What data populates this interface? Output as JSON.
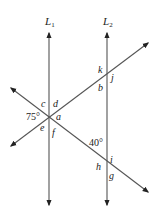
{
  "diagram": {
    "type": "parallel lines cut by two transversals",
    "lines": {
      "L1": {
        "label": "L",
        "subscript": "1"
      },
      "L2": {
        "label": "L",
        "subscript": "2"
      }
    },
    "angle_labels": {
      "a": "a",
      "b": "b",
      "c": "c",
      "d": "d",
      "e": "e",
      "f": "f",
      "g": "g",
      "h": "h",
      "i": "i",
      "j": "j",
      "k": "k"
    },
    "given_angles": {
      "angle_75": "75°",
      "angle_40": "40°"
    },
    "colors": {
      "line": "#555555",
      "text": "#222222",
      "background": "#ffffff"
    }
  }
}
